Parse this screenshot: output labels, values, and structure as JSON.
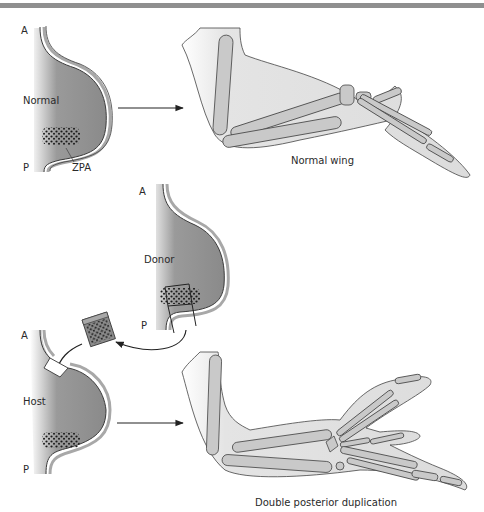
{
  "figure": {
    "top_rule_color": "#8f8f8f",
    "panels": {
      "normal": {
        "limb_bud": {
          "label": "Normal",
          "anterior": "A",
          "posterior": "P",
          "zpa_label": "ZPA"
        },
        "result_label": "Normal wing"
      },
      "donor": {
        "limb_bud": {
          "label": "Donor",
          "anterior": "A",
          "posterior": "P"
        }
      },
      "host": {
        "limb_bud": {
          "label": "Host",
          "anterior": "A",
          "posterior": "P"
        },
        "result_label": "Double posterior duplication"
      }
    },
    "colors": {
      "bud_fill": "#8c8c8c",
      "bud_rim": "#a8a8a8",
      "wing_fill": "#e2e2e2",
      "bone_fill": "#c9c9c9",
      "outline": "#3a3a3a",
      "dots": "#1a1a1a"
    }
  }
}
